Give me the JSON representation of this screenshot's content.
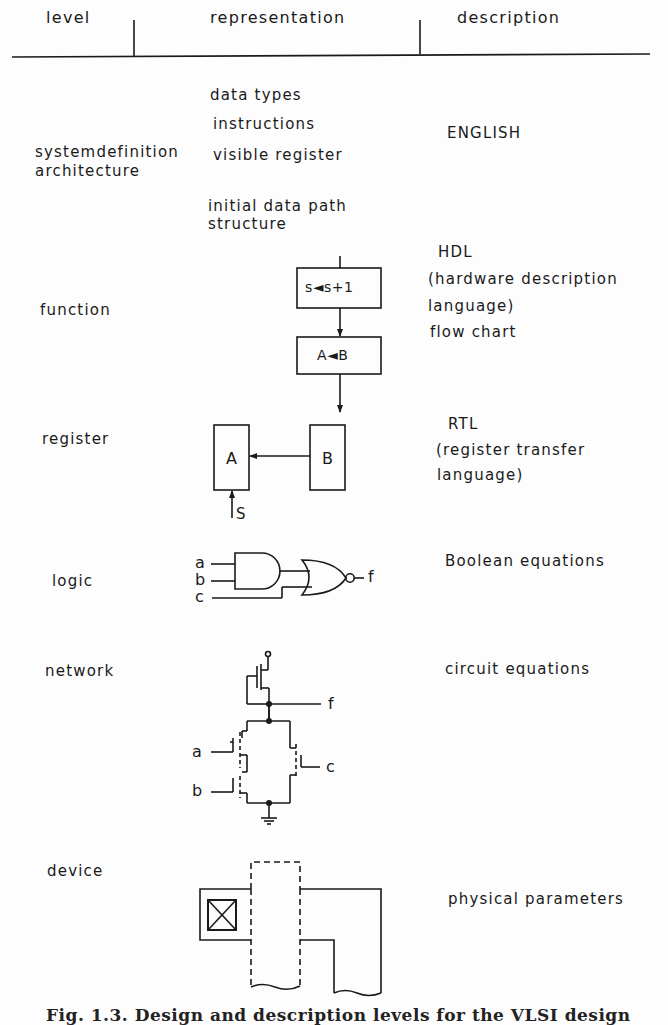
{
  "table": {
    "headers": {
      "level": "level",
      "representation": "representation",
      "description": "description"
    },
    "rows": [
      {
        "level": [
          "systemdefinition",
          "architecture"
        ],
        "representation": [
          "data types",
          "instructions",
          "visible register",
          "initial data  path",
          "structure"
        ],
        "description": [
          "ENGLISH"
        ]
      },
      {
        "level": [
          "function"
        ],
        "representation_diagram": {
          "type": "flow-chart",
          "boxes": [
            "s◄s+1",
            "A◄B"
          ]
        },
        "description": [
          "HDL",
          "(hardware description",
          "language)",
          "flow chart"
        ]
      },
      {
        "level": [
          "register"
        ],
        "representation_diagram": {
          "type": "register-transfer",
          "registers": [
            "A",
            "B"
          ],
          "control_signal": "S"
        },
        "description": [
          "RTL",
          "(register transfer",
          "language)"
        ]
      },
      {
        "level": [
          "logic"
        ],
        "representation_diagram": {
          "type": "gate-schematic",
          "inputs": [
            "a",
            "b",
            "c"
          ],
          "output": "f",
          "gates": [
            "AND",
            "NOR"
          ]
        },
        "description": [
          "Boolean equations"
        ]
      },
      {
        "level": [
          "network"
        ],
        "representation_diagram": {
          "type": "transistor-schematic",
          "inputs": [
            "a",
            "b",
            "c"
          ],
          "output": "f"
        },
        "description": [
          "circuit equations"
        ]
      },
      {
        "level": [
          "device"
        ],
        "representation_diagram": {
          "type": "layout"
        },
        "description": [
          "physical parameters"
        ]
      }
    ]
  },
  "labels": {
    "flow_box1": "s◄s+1",
    "flow_box2": "A◄B",
    "reg_a": "A",
    "reg_b": "B",
    "reg_s": "S",
    "in_a": "a",
    "in_b": "b",
    "in_c": "c",
    "out_f": "f"
  },
  "caption": "Fig. 1.3. Design and description levels for the VLSI design"
}
